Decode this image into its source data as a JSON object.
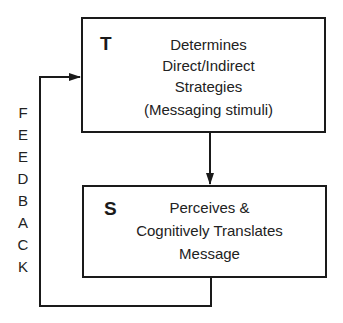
{
  "diagram": {
    "top_box": {
      "letter": "T",
      "lines": [
        "Determines",
        "Direct/Indirect",
        "Strategies",
        "(Messaging stimuli)"
      ]
    },
    "bottom_box": {
      "letter": "S",
      "lines": [
        "Perceives &",
        "Cognitively Translates",
        "Message"
      ]
    },
    "feedback_label": {
      "text": "FEEDBACK",
      "letters": [
        "F",
        "E",
        "E",
        "D",
        "B",
        "A",
        "C",
        "K"
      ]
    },
    "colors": {
      "line": "#1a1a1a",
      "background": "#ffffff"
    }
  }
}
